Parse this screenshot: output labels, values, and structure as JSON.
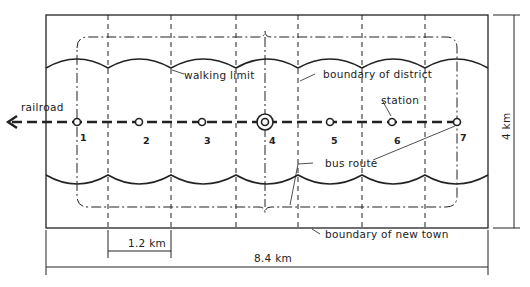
{
  "labels": {
    "railroad": "railroad",
    "walking_limit": "walking limit",
    "boundary_of_district": "boundary of district",
    "station": "station",
    "bus_route": "bus route",
    "boundary_of_new_town": "boundary of new town"
  },
  "dimensions": {
    "district_width": "1.2 km",
    "town_length": "8.4 km",
    "town_width": "4 km"
  },
  "stations": [
    {
      "label": "1"
    },
    {
      "label": "2"
    },
    {
      "label": "3"
    },
    {
      "label": "4"
    },
    {
      "label": "5"
    },
    {
      "label": "6"
    },
    {
      "label": "7"
    }
  ],
  "colors": {
    "ink": "#222222",
    "background": "#ffffff"
  }
}
